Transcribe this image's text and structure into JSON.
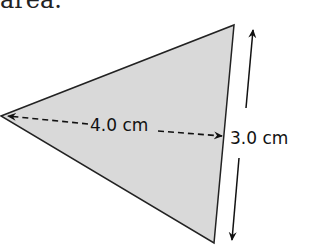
{
  "text_fragment": "area.",
  "diagram": {
    "shape": "triangle",
    "fill_color": "#d9d9d9",
    "stroke_color": "#222222",
    "base_label": "4.0 cm",
    "height_label": "3.0 cm"
  }
}
